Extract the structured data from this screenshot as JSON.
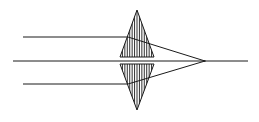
{
  "diagram": {
    "colors": {
      "stroke": "#1a1a1a",
      "background": "#ffffff"
    },
    "optical_axis": {
      "x1": 13,
      "x2": 248,
      "y": 61
    },
    "lens": {
      "center_x": 137,
      "top_y": 10,
      "bottom_y": 110,
      "half_width": 17,
      "gap_top_y": 57,
      "gap_bottom_y": 64,
      "hatch_count": 14
    },
    "rays": [
      {
        "name": "upper-ray",
        "y": 37,
        "x_start": 23
      },
      {
        "name": "lower-ray",
        "y": 84,
        "x_start": 23
      }
    ],
    "focal_point": {
      "x": 205,
      "y": 61
    }
  }
}
